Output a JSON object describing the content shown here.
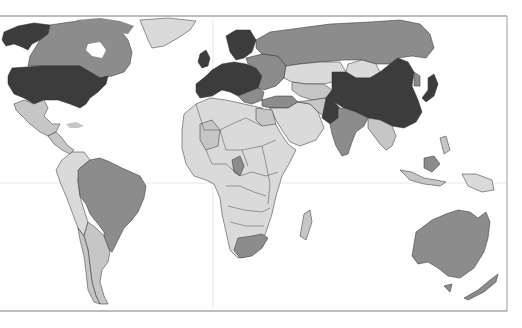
{
  "map": {
    "type": "choropleth-world-map",
    "palette": {
      "background": "#ffffff",
      "frame": "#7a7a7a",
      "grid": "#d4d4d4",
      "tier_dark": "#3c3c3c",
      "tier_medium": "#8c8c8c",
      "tier_light": "#c6c6c6",
      "tier_lightest": "#dadada"
    },
    "regions": [
      {
        "name": "Alaska",
        "tier": "dark"
      },
      {
        "name": "Canada",
        "tier": "medium"
      },
      {
        "name": "Greenland",
        "tier": "lightest"
      },
      {
        "name": "United States",
        "tier": "dark"
      },
      {
        "name": "Mexico",
        "tier": "light"
      },
      {
        "name": "Central America",
        "tier": "light"
      },
      {
        "name": "Brazil",
        "tier": "medium"
      },
      {
        "name": "Andean South America",
        "tier": "lightest"
      },
      {
        "name": "Argentina",
        "tier": "light"
      },
      {
        "name": "Western Europe",
        "tier": "dark"
      },
      {
        "name": "Scandinavia",
        "tier": "dark"
      },
      {
        "name": "Eastern Europe",
        "tier": "medium"
      },
      {
        "name": "Russia",
        "tier": "medium"
      },
      {
        "name": "Kazakhstan",
        "tier": "lightest"
      },
      {
        "name": "Mongolia",
        "tier": "lightest"
      },
      {
        "name": "China",
        "tier": "dark"
      },
      {
        "name": "Japan",
        "tier": "dark"
      },
      {
        "name": "Pakistan",
        "tier": "dark"
      },
      {
        "name": "India",
        "tier": "medium"
      },
      {
        "name": "Middle East",
        "tier": "lightest"
      },
      {
        "name": "Africa",
        "tier": "lightest"
      },
      {
        "name": "Egypt",
        "tier": "light"
      },
      {
        "name": "South Africa",
        "tier": "medium"
      },
      {
        "name": "Madagascar",
        "tier": "light"
      },
      {
        "name": "Southeast Asia",
        "tier": "light"
      },
      {
        "name": "Indonesia",
        "tier": "light"
      },
      {
        "name": "Australia",
        "tier": "medium"
      },
      {
        "name": "New Zealand",
        "tier": "medium"
      }
    ]
  }
}
